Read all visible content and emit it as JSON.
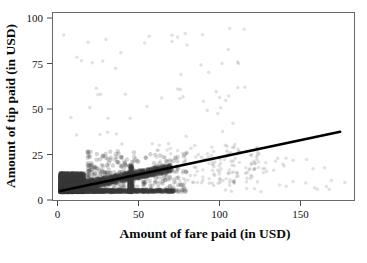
{
  "chart_data": {
    "type": "scatter",
    "title": "",
    "xlabel": "Amount of fare paid (in USD)",
    "ylabel": "Amount of tip paid (in USD)",
    "xlim": [
      -4,
      185
    ],
    "ylim": [
      -5,
      105
    ],
    "xticks": [
      0,
      50,
      100,
      150
    ],
    "yticks": [
      0,
      25,
      50,
      75,
      100
    ],
    "xtick_labels": [
      "0",
      "50",
      "100",
      "150"
    ],
    "ytick_labels": [
      "0",
      "25",
      "50",
      "75",
      "100"
    ],
    "grid": false,
    "legend": null,
    "marker_color": "#3a3a3a",
    "marker_opacity": 0.22,
    "marker_size": 2.2,
    "fit_line": {
      "color": "#000000",
      "width": 2.6,
      "intercept": 0.35,
      "slope": 0.198,
      "x_start": 1.0,
      "x_end": 176.0,
      "y_start": 0.55,
      "y_end": 35.2
    },
    "point_clusters": [
      {
        "name": "dense-low-fare-core",
        "n": 2600,
        "x_range": [
          1,
          16
        ],
        "y_range": [
          0,
          11
        ],
        "density": "very-high"
      },
      {
        "name": "zero-tip-baseline",
        "n": 900,
        "x_range": [
          1,
          72
        ],
        "y_range": [
          0,
          1.2
        ],
        "density": "high"
      },
      {
        "name": "proportional-band",
        "n": 1500,
        "x_range": [
          4,
          70
        ],
        "y_range": [
          1,
          17
        ],
        "density": "high"
      },
      {
        "name": "mid-fare-spread",
        "n": 420,
        "x_range": [
          18,
          80
        ],
        "y_range": [
          0,
          24
        ],
        "density": "medium"
      },
      {
        "name": "flat-rate-streak-45",
        "n": 260,
        "x_range": [
          44,
          46
        ],
        "y_range": [
          0,
          16
        ],
        "density": "high"
      },
      {
        "name": "upper-band-tail",
        "n": 150,
        "x_range": [
          60,
          130
        ],
        "y_range": [
          5,
          28
        ],
        "density": "low"
      },
      {
        "name": "sparse-outliers-high-tip",
        "n": 60,
        "x_range": [
          2,
          120
        ],
        "y_range": [
          28,
          98
        ],
        "density": "very-low"
      },
      {
        "name": "long-fare-tail",
        "n": 45,
        "x_range": [
          95,
          180
        ],
        "y_range": [
          0,
          22
        ],
        "density": "very-low"
      }
    ]
  },
  "figure": {
    "background_color": "#ffffff",
    "frame_color": "#6a6a6a"
  }
}
